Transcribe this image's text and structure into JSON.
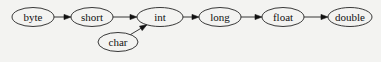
{
  "diagram": {
    "type": "directed-graph",
    "nodes": [
      {
        "id": "byte",
        "label": "byte",
        "cx": 33,
        "cy": 17,
        "rx": 21,
        "ry": 9.5
      },
      {
        "id": "short",
        "label": "short",
        "cx": 92,
        "cy": 17,
        "rx": 21,
        "ry": 9.5
      },
      {
        "id": "int",
        "label": "int",
        "cx": 160,
        "cy": 17,
        "rx": 23,
        "ry": 9.5
      },
      {
        "id": "char",
        "label": "char",
        "cx": 118,
        "cy": 42,
        "rx": 20,
        "ry": 9.5
      },
      {
        "id": "long",
        "label": "long",
        "cx": 220,
        "cy": 17,
        "rx": 21,
        "ry": 9.5
      },
      {
        "id": "float",
        "label": "float",
        "cx": 283,
        "cy": 17,
        "rx": 21,
        "ry": 9.5
      },
      {
        "id": "double",
        "label": "double",
        "cx": 350,
        "cy": 17,
        "rx": 22,
        "ry": 9.5
      }
    ],
    "edges": [
      {
        "from": "byte",
        "to": "short"
      },
      {
        "from": "short",
        "to": "int"
      },
      {
        "from": "char",
        "to": "int"
      },
      {
        "from": "int",
        "to": "long"
      },
      {
        "from": "long",
        "to": "float"
      },
      {
        "from": "float",
        "to": "double"
      }
    ]
  }
}
